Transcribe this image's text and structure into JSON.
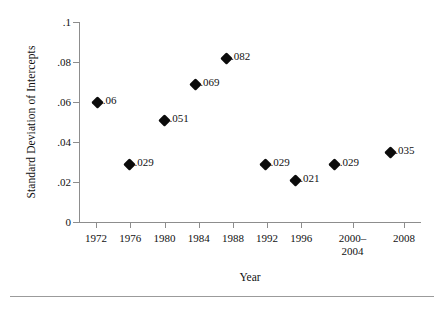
{
  "chart_data": {
    "type": "scatter",
    "title": "",
    "xlabel": "Year",
    "ylabel": "Standard Deviation of Intercepts",
    "xlim": [
      1970,
      2010
    ],
    "ylim": [
      0,
      0.1
    ],
    "grid": false,
    "legend": "none",
    "marker": "black-diamond",
    "x_tick_labels": [
      "1972",
      "1976",
      "1980",
      "1984",
      "1988",
      "1992",
      "1996",
      "2000–\n2004",
      "2008"
    ],
    "x_ticks": [
      {
        "label_line1": "1972",
        "label_line2": "",
        "value": 1972
      },
      {
        "label_line1": "1976",
        "label_line2": "",
        "value": 1976
      },
      {
        "label_line1": "1980",
        "label_line2": "",
        "value": 1980
      },
      {
        "label_line1": "1984",
        "label_line2": "",
        "value": 1984
      },
      {
        "label_line1": "1988",
        "label_line2": "",
        "value": 1988
      },
      {
        "label_line1": "1992",
        "label_line2": "",
        "value": 1992
      },
      {
        "label_line1": "1996",
        "label_line2": "",
        "value": 1996
      },
      {
        "label_line1": "2000–",
        "label_line2": "2004",
        "value": 2002
      },
      {
        "label_line1": "2008",
        "label_line2": "",
        "value": 2008
      }
    ],
    "y_ticks": [
      {
        "label": "0",
        "value": 0
      },
      {
        "label": ".02",
        "value": 0.02
      },
      {
        "label": ".04",
        "value": 0.04
      },
      {
        "label": ".06",
        "value": 0.06
      },
      {
        "label": ".08",
        "value": 0.08
      },
      {
        "label": ".1",
        "value": 0.1
      }
    ],
    "points": [
      {
        "x": 1972.2,
        "y": 0.06,
        "label": ".06"
      },
      {
        "x": 1975.9,
        "y": 0.029,
        "label": ".029"
      },
      {
        "x": 1980.0,
        "y": 0.051,
        "label": ".051"
      },
      {
        "x": 1983.6,
        "y": 0.069,
        "label": ".069"
      },
      {
        "x": 1987.2,
        "y": 0.082,
        "label": ".082"
      },
      {
        "x": 1991.8,
        "y": 0.029,
        "label": ".029"
      },
      {
        "x": 1995.3,
        "y": 0.021,
        "label": ".021"
      },
      {
        "x": 1999.9,
        "y": 0.029,
        "label": ".029"
      },
      {
        "x": 2006.4,
        "y": 0.035,
        "label": ".035"
      }
    ],
    "series": [
      {
        "name": "Standard Deviation of Intercepts",
        "x": [
          1972,
          1976,
          1980,
          1984,
          1988,
          1992,
          1996,
          2002,
          2008
        ],
        "values": [
          0.06,
          0.029,
          0.051,
          0.069,
          0.082,
          0.029,
          0.021,
          0.029,
          0.035
        ]
      }
    ],
    "colors": {
      "marker": "#0b0b0b",
      "axis": "#8d8d8d",
      "text": "#111111",
      "background": "#ffffff",
      "rule": "#9b9b9b"
    }
  }
}
